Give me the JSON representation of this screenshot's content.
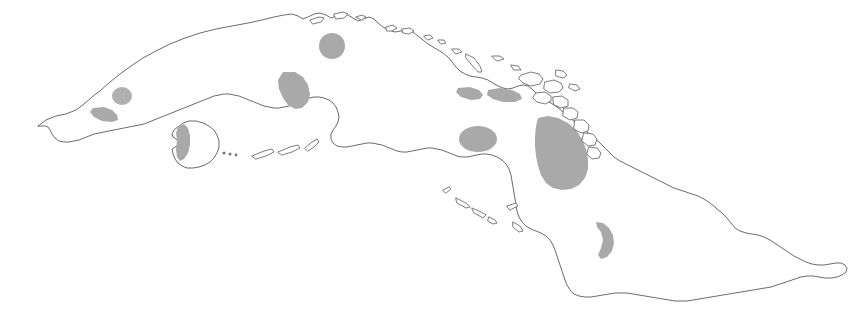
{
  "figure": {
    "background_color": "#ffffff",
    "width": 866,
    "height": 319
  },
  "style": {
    "coastline_color": "#5a5a5a",
    "coastline_width": 0.9,
    "land_fill": "#ffffff",
    "region_fill": "#a9a9a9",
    "region_fill_light": "#b4b4b4",
    "cay_outline_color": "#5a5a5a",
    "cay_dot_color": "#777777"
  },
  "landmasses": [
    {
      "name": "main-island",
      "label": "Cuba mainland",
      "path": "M 38,126 L 46,120 L 56,116 L 66,114 L 76,110 L 84,104 L 92,97 L 101,90 L 110,82 L 120,74 L 131,66 L 143,58 L 156,51 L 170,44 L 185,38 L 200,33 L 216,29 L 232,26 L 248,23 L 262,20 L 274,17 L 284,15 L 292,14 L 298,16 L 303,19 L 308,17 L 314,14 L 320,13 L 326,15 L 331,18 L 336,16 L 342,14 L 348,15 L 353,18 L 358,21 L 363,19 L 369,17 L 374,19 L 378,23 L 383,27 L 389,30 L 395,32 L 401,31 L 407,30 L 413,32 L 418,36 L 423,40 L 428,44 L 433,47 L 438,50 L 443,53 L 448,57 L 452,62 L 456,67 L 460,71 L 465,74 L 470,76 L 476,77 L 482,78 L 488,80 L 493,83 L 498,86 L 503,88 L 508,89 L 513,88 L 518,86 L 523,85 L 528,86 L 532,89 L 536,93 L 540,97 L 545,100 L 551,103 L 557,107 L 563,112 L 569,117 L 575,122 L 581,127 L 587,132 L 593,137 L 599,142 L 604,147 L 609,152 L 614,157 L 620,161 L 626,164 L 632,167 L 638,170 L 644,173 L 650,176 L 656,179 L 662,182 L 668,185 L 674,188 L 680,190 L 686,192 L 692,194 L 698,196 L 704,199 L 710,203 L 716,208 L 722,213 L 727,218 L 731,223 L 735,228 L 740,231 L 746,233 L 752,234 L 758,235 L 764,237 L 770,240 L 776,244 L 782,248 L 788,252 L 794,256 L 800,259 L 806,262 L 812,264 L 818,265 L 824,265 L 830,264 L 836,263 L 841,263 L 845,265 L 847,268 L 846,272 L 842,275 L 837,277 L 831,278 L 825,278 L 819,277 L 813,276 L 807,276 L 801,277 L 795,279 L 789,281 L 783,283 L 777,285 L 771,287 L 765,288 L 759,289 L 753,290 L 747,291 L 741,292 L 735,293 L 729,294 L 723,295 L 717,296 L 711,297 L 705,298 L 699,299 L 693,300 L 687,301 L 681,301 L 675,301 L 669,300 L 663,299 L 657,298 L 651,297 L 645,296 L 639,295 L 633,294 L 627,293 L 621,293 L 615,293 L 609,294 L 603,295 L 597,296 L 591,297 L 585,297 L 579,296 L 574,294 L 570,290 L 567,285 L 565,280 L 563,274 L 561,268 L 559,262 L 557,256 L 555,250 L 553,245 L 550,240 L 546,236 L 541,233 L 536,231 L 531,229 L 526,226 L 522,222 L 519,217 L 517,211 L 516,205 L 515,199 L 514,193 L 513,187 L 512,181 L 511,175 L 509,169 L 506,164 L 502,160 L 497,157 L 492,155 L 487,154 L 482,154 L 477,155 L 472,156 L 467,157 L 462,157 L 457,156 L 452,154 L 447,152 L 442,150 L 437,149 L 432,148 L 427,148 L 422,149 L 417,150 L 412,151 L 407,152 L 402,152 L 397,151 L 392,149 L 387,147 L 382,145 L 377,144 L 372,143 L 367,143 L 362,144 L 357,145 L 352,146 L 347,147 L 342,147 L 337,146 L 333,143 L 331,139 L 331,134 L 333,130 L 336,126 L 338,122 L 339,117 L 338,112 L 336,107 L 333,103 L 329,100 L 324,98 L 319,97 L 314,97 L 309,98 L 304,100 L 299,102 L 294,104 L 289,106 L 284,107 L 279,108 L 274,108 L 269,107 L 264,106 L 259,104 L 254,102 L 249,100 L 244,98 L 239,96 L 234,95 L 229,94 L 224,94 L 219,95 L 214,96 L 209,98 L 204,100 L 199,102 L 194,104 L 189,106 L 184,108 L 179,110 L 174,112 L 169,114 L 164,116 L 159,118 L 154,120 L 149,122 L 144,124 L 139,125 L 134,126 L 129,127 L 124,128 L 119,129 L 114,130 L 109,131 L 104,132 L 99,133 L 94,134 L 89,136 L 84,138 L 79,140 L 74,141 L 69,142 L 64,142 L 59,141 L 55,138 L 52,134 L 50,130 L 48,127 L 45,126 Z",
      "interactable": false
    },
    {
      "name": "isla-de-la-juventud",
      "label": "Isla de la Juventud",
      "path": "M 178,127 L 183,123 L 189,121 L 196,121 L 203,123 L 209,126 L 214,130 L 217,135 L 219,141 L 219,147 L 217,153 L 214,158 L 210,162 L 205,165 L 199,167 L 193,168 L 187,168 L 182,166 L 178,163 L 175,159 L 173,154 L 172,149 L 175,147 L 178,146 L 180,144 L 179,141 L 176,139 L 173,137 L 172,134 L 174,130 Z",
      "interactable": false
    }
  ],
  "shaded_regions": [
    {
      "name": "region-guanahacabibes",
      "label": "Far western circular region",
      "type": "ellipse",
      "cx": 122,
      "cy": 96,
      "rx": 10,
      "ry": 9,
      "fill": "#b0b0b0"
    },
    {
      "name": "region-western-coast",
      "label": "Western coastal wedge",
      "type": "path",
      "path": "M 93,108 L 104,107 L 112,110 L 117,115 L 118,120 L 112,122 L 102,121 L 94,117 L 90,112 Z",
      "fill": "#a9a9a9"
    },
    {
      "name": "region-havana",
      "label": "North-central rounded region near Havana",
      "type": "ellipse",
      "cx": 332,
      "cy": 46,
      "rx": 13,
      "ry": 13,
      "fill": "#a9a9a9"
    },
    {
      "name": "region-zapata",
      "label": "Zapata swamp region",
      "type": "path",
      "path": "M 283,72 L 295,72 L 303,77 L 308,85 L 310,94 L 308,102 L 302,108 L 295,109 L 288,105 L 283,98 L 279,89 L 278,80 Z",
      "fill": "#a9a9a9"
    },
    {
      "name": "region-central-south-oval",
      "label": "Central-south oval region",
      "type": "ellipse",
      "cx": 478,
      "cy": 139,
      "rx": 19,
      "ry": 13,
      "fill": "#a9a9a9"
    },
    {
      "name": "region-north-coast-west-patch",
      "label": "North coast elongated patch west",
      "type": "path",
      "path": "M 458,88 L 470,87 L 479,90 L 483,95 L 480,99 L 471,100 L 461,97 L 456,92 Z",
      "fill": "#a9a9a9"
    },
    {
      "name": "region-north-coast-east-patch",
      "label": "North coast elongated patch east",
      "type": "path",
      "path": "M 488,90 L 500,88 L 512,90 L 520,94 L 522,99 L 515,102 L 503,102 L 493,99 L 487,95 Z",
      "fill": "#a9a9a9"
    },
    {
      "name": "region-camaguey",
      "label": "Large Camaguey shaded region",
      "type": "path",
      "path": "M 538,118 L 548,116 L 558,118 L 568,123 L 576,130 L 582,139 L 586,149 L 588,159 L 588,169 L 585,178 L 579,185 L 571,189 L 562,190 L 553,188 L 546,183 L 541,175 L 538,166 L 536,156 L 535,146 L 535,136 L 536,126 Z",
      "fill": "#a9a9a9"
    },
    {
      "name": "region-guantanamo-crescent",
      "label": "Eastern crescent region near Guantanamo",
      "type": "path",
      "path": "M 596,222 L 603,223 L 609,228 L 613,235 L 614,243 L 612,251 L 607,257 L 601,259 L 598,255 L 601,248 L 603,240 L 601,232 L 597,227 Z",
      "fill": "#a9a9a9"
    },
    {
      "name": "region-isla-juventud-west",
      "label": "Western shading on Isla de la Juventud",
      "type": "path",
      "path": "M 178,127 L 184,124 L 188,128 L 190,136 L 190,145 L 188,153 L 184,159 L 180,161 L 177,157 L 176,149 L 177,140 L 176,133 Z",
      "fill": "#a9a9a9"
    }
  ],
  "cays": [
    {
      "name": "cay-group-canarreos",
      "label": "Archipielago de los Canarreos",
      "shapes": [
        {
          "type": "dot",
          "cx": 224,
          "cy": 153,
          "r": 1.6
        },
        {
          "type": "dot",
          "cx": 230,
          "cy": 154,
          "r": 1.5
        },
        {
          "type": "dot",
          "cx": 236,
          "cy": 155,
          "r": 1.4
        },
        {
          "type": "sliver",
          "path": "M 252,156 L 264,151 L 272,149 L 274,152 L 266,156 L 256,159 Z"
        },
        {
          "type": "sliver",
          "path": "M 278,152 L 290,147 L 298,145 L 300,148 L 292,152 L 282,155 Z"
        },
        {
          "type": "sliver",
          "path": "M 305,148 L 312,142 L 317,139 L 319,142 L 314,147 L 308,151 Z"
        }
      ]
    },
    {
      "name": "cay-group-jardines-de-la-reina",
      "label": "Jardines de la Reina",
      "shapes": [
        {
          "type": "sliver",
          "path": "M 443,190 L 449,187 L 451,189 L 446,193 Z"
        },
        {
          "type": "sliver",
          "path": "M 456,198 L 466,203 L 470,207 L 466,208 L 457,203 Z"
        },
        {
          "type": "sliver",
          "path": "M 472,208 L 481,212 L 486,215 L 483,218 L 474,213 Z"
        },
        {
          "type": "sliver",
          "path": "M 489,217 L 495,220 L 497,223 L 493,224 L 488,221 Z"
        },
        {
          "type": "sliver",
          "path": "M 507,206 L 516,203 L 518,206 L 510,210 Z"
        },
        {
          "type": "sliver",
          "path": "M 513,222 L 520,226 L 523,231 L 519,232 L 513,227 Z"
        }
      ]
    },
    {
      "name": "cay-group-sabana-camaguey",
      "label": "Sabana-Camaguey archipelago (north coast keys)",
      "shapes": [
        {
          "type": "sliver",
          "path": "M 310,20 L 319,17 L 324,18 L 321,22 L 313,24 Z"
        },
        {
          "type": "sliver",
          "path": "M 334,14 L 343,12 L 348,14 L 344,18 L 336,19 Z"
        },
        {
          "type": "sliver",
          "path": "M 356,17 L 362,15 L 366,17 L 362,20 Z"
        },
        {
          "type": "sliver",
          "path": "M 386,27 L 393,25 L 397,28 L 392,31 L 387,31 Z"
        },
        {
          "type": "sliver",
          "path": "M 402,29 L 410,28 L 414,31 L 409,34 L 403,33 Z"
        },
        {
          "type": "sliver",
          "path": "M 424,36 L 430,35 L 433,38 L 428,40 Z"
        },
        {
          "type": "sliver",
          "path": "M 438,40 L 444,40 L 446,43 L 441,44 Z"
        },
        {
          "type": "sliver",
          "path": "M 452,49 L 459,49 L 462,52 L 456,54 Z"
        },
        {
          "type": "sliver",
          "path": "M 466,54 L 474,58 L 480,66 L 482,72 L 478,72 L 471,64 L 466,58 Z"
        },
        {
          "type": "sliver",
          "path": "M 492,56 L 500,56 L 504,59 L 497,61 Z"
        },
        {
          "type": "sliver",
          "path": "M 511,65 L 518,66 L 521,70 L 514,70 Z"
        }
      ]
    },
    {
      "name": "cay-group-northeast-keys",
      "label": "Northeastern keys cluster",
      "shapes": [
        {
          "type": "outline",
          "path": "M 521,75 L 531,72 L 539,74 L 543,79 L 540,84 L 531,86 L 523,83 L 519,79 Z"
        },
        {
          "type": "outline",
          "path": "M 545,82 L 554,80 L 561,83 L 563,88 L 559,92 L 550,93 L 544,89 Z"
        },
        {
          "type": "outline",
          "path": "M 536,93 L 545,92 L 551,96 L 551,101 L 545,104 L 537,102 L 533,98 Z"
        },
        {
          "type": "outline",
          "path": "M 553,97 L 562,96 L 568,100 L 568,106 L 561,108 L 554,105 Z"
        },
        {
          "type": "outline",
          "path": "M 564,108 L 573,108 L 578,112 L 577,118 L 570,120 L 563,116 Z"
        },
        {
          "type": "outline",
          "path": "M 575,120 L 584,120 L 589,125 L 588,131 L 581,133 L 574,129 Z"
        },
        {
          "type": "outline",
          "path": "M 584,133 L 593,134 L 597,139 L 595,145 L 588,146 L 582,141 Z"
        },
        {
          "type": "outline",
          "path": "M 589,147 L 597,148 L 601,153 L 599,158 L 592,159 L 587,154 Z"
        },
        {
          "type": "outline",
          "path": "M 556,70 L 563,71 L 567,75 L 563,78 L 556,76 Z"
        },
        {
          "type": "outline",
          "path": "M 570,84 L 577,85 L 580,89 L 575,91 L 569,88 Z"
        }
      ]
    }
  ]
}
